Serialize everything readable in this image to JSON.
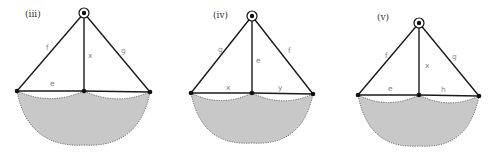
{
  "figure": {
    "width": 496,
    "height": 158,
    "colors": {
      "edge": "#1a1a1a",
      "region_fill": "#c8c8c8",
      "region_border": "#555555",
      "label": "#8a8a8a",
      "title": "#333333"
    },
    "panels": [
      {
        "id": "iii",
        "title": "(iii)",
        "title_pos": [
          25,
          17
        ],
        "pivot": [
          84,
          13
        ],
        "left": [
          17,
          91
        ],
        "mid": [
          84,
          91
        ],
        "right": [
          150,
          92
        ],
        "bottom_y": 145,
        "edges": {
          "left_diag": "f",
          "vertical": "x",
          "right_diag": "g",
          "left_horizontal": "e",
          "right_horizontal": ""
        },
        "labels": [
          {
            "text": "f",
            "pos": [
              46,
              50
            ]
          },
          {
            "text": "x",
            "pos": [
              88,
              58
            ]
          },
          {
            "text": "g",
            "pos": [
              121,
              53
            ]
          },
          {
            "text": "e",
            "pos": [
              50,
              86
            ]
          }
        ]
      },
      {
        "id": "iv",
        "title": "(iv)",
        "title_pos": [
          213,
          18
        ],
        "pivot": [
          252,
          16
        ],
        "left": [
          191,
          93
        ],
        "mid": [
          252,
          93
        ],
        "right": [
          313,
          94
        ],
        "bottom_y": 143,
        "edges": {
          "left_diag": "g",
          "vertical": "e",
          "right_diag": "f",
          "left_horizontal": "x",
          "right_horizontal": "y"
        },
        "labels": [
          {
            "text": "g",
            "pos": [
              218,
              52
            ]
          },
          {
            "text": "e",
            "pos": [
              256,
              63
            ]
          },
          {
            "text": "f",
            "pos": [
              288,
              53
            ]
          },
          {
            "text": "x",
            "pos": [
              226,
              90
            ]
          },
          {
            "text": "y",
            "pos": [
              278,
              90
            ]
          }
        ]
      },
      {
        "id": "v",
        "title": "(v)",
        "title_pos": [
          377,
          20
        ],
        "pivot": [
          419,
          23
        ],
        "left": [
          358,
          95
        ],
        "mid": [
          419,
          95
        ],
        "right": [
          479,
          96
        ],
        "bottom_y": 146,
        "edges": {
          "left_diag": "f",
          "vertical": "x",
          "right_diag": "g",
          "left_horizontal": "e",
          "right_horizontal": "h"
        },
        "labels": [
          {
            "text": "f",
            "pos": [
              385,
              58
            ]
          },
          {
            "text": "x",
            "pos": [
              425,
              68
            ]
          },
          {
            "text": "g",
            "pos": [
              452,
              59
            ]
          },
          {
            "text": "e",
            "pos": [
              388,
              91
            ]
          },
          {
            "text": "h",
            "pos": [
              441,
              92
            ]
          }
        ]
      }
    ]
  }
}
